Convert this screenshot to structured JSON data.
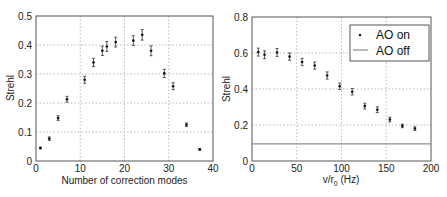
{
  "chart_data": [
    {
      "type": "scatter",
      "title": "",
      "xlabel": "Number of correction modes",
      "ylabel": "Strehl",
      "xlim": [
        0,
        40
      ],
      "ylim": [
        0,
        0.5
      ],
      "xticks": [
        0,
        10,
        20,
        30,
        40
      ],
      "yticks": [
        0,
        0.1,
        0.2,
        0.3,
        0.4,
        0.5
      ],
      "xtick_labels": [
        "0",
        "10",
        "20",
        "30",
        "40"
      ],
      "ytick_labels": [
        "0",
        "0.1",
        "0.2",
        "0.3",
        "0.4",
        "0.5"
      ],
      "grid": true,
      "series": [
        {
          "name": "Strehl",
          "marker": "dot-with-errorbar",
          "x": [
            1,
            3,
            5,
            7,
            11,
            13,
            15,
            16,
            18,
            22,
            24,
            26,
            29,
            31,
            34,
            37
          ],
          "y": [
            0.045,
            0.077,
            0.148,
            0.213,
            0.28,
            0.34,
            0.38,
            0.395,
            0.41,
            0.415,
            0.435,
            0.38,
            0.302,
            0.258,
            0.125,
            0.04
          ],
          "err": [
            0.003,
            0.006,
            0.008,
            0.01,
            0.012,
            0.014,
            0.016,
            0.017,
            0.017,
            0.017,
            0.018,
            0.017,
            0.014,
            0.012,
            0.006,
            0.003
          ]
        }
      ]
    },
    {
      "type": "scatter",
      "title": "",
      "xlabel": "v/r0 (Hz)",
      "ylabel": "Strehl",
      "xlim": [
        0,
        200
      ],
      "ylim": [
        0,
        0.8
      ],
      "xticks": [
        0,
        50,
        100,
        150,
        200
      ],
      "yticks": [
        0,
        0.2,
        0.4,
        0.6,
        0.8
      ],
      "xtick_labels": [
        "0",
        "50",
        "100",
        "150",
        "200"
      ],
      "ytick_labels": [
        "0",
        "0.2",
        "0.4",
        "0.6",
        "0.8"
      ],
      "grid": true,
      "legend_position": "upper right",
      "legend": [
        "AO on",
        "AO off"
      ],
      "series": [
        {
          "name": "AO on",
          "marker": "dot-with-errorbar",
          "x": [
            7,
            14,
            28,
            42,
            56,
            70,
            84,
            98,
            112,
            126,
            140,
            154,
            168,
            182
          ],
          "y": [
            0.605,
            0.59,
            0.603,
            0.58,
            0.55,
            0.53,
            0.475,
            0.415,
            0.385,
            0.305,
            0.285,
            0.23,
            0.195,
            0.18
          ],
          "err": [
            0.022,
            0.022,
            0.022,
            0.02,
            0.02,
            0.02,
            0.02,
            0.018,
            0.018,
            0.016,
            0.016,
            0.013,
            0.01,
            0.01
          ]
        },
        {
          "name": "AO off",
          "style": "horizontal-line",
          "y": 0.095
        }
      ]
    }
  ],
  "left_chart": {
    "xlabel": "Number of correction modes",
    "ylabel": "Strehl",
    "xtick_labels": [
      "0",
      "10",
      "20",
      "30",
      "40"
    ],
    "ytick_labels": [
      "0",
      "0.1",
      "0.2",
      "0.3",
      "0.4",
      "0.5"
    ]
  },
  "right_chart": {
    "xlabel_main": "v/r",
    "xlabel_sub": "0",
    "xlabel_units": " (Hz)",
    "ylabel": "Strehl",
    "xtick_labels": [
      "0",
      "50",
      "100",
      "150",
      "200"
    ],
    "ytick_labels": [
      "0",
      "0.2",
      "0.4",
      "0.6",
      "0.8"
    ],
    "legend": {
      "ao_on": "AO on",
      "ao_off": "AO off"
    }
  },
  "colors": {
    "axis": "#555555",
    "grid": "#bbbbbb",
    "marker": "#111111",
    "ao_off_line": "#777777"
  }
}
